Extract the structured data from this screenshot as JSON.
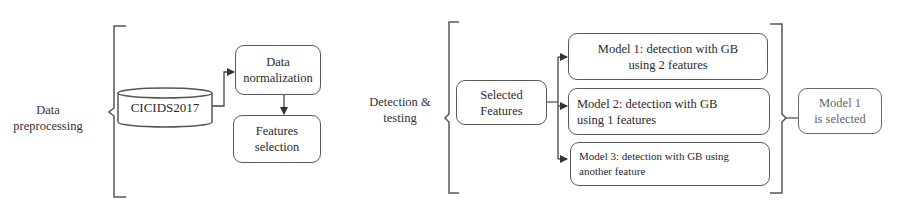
{
  "diagram": {
    "sections": [
      {
        "label_lines": [
          "Data",
          "preprocessing"
        ],
        "datasource": "CICIDS2017",
        "steps": [
          {
            "lines": [
              "Data",
              "normalization"
            ]
          },
          {
            "lines": [
              "Features",
              "selection"
            ]
          }
        ]
      },
      {
        "label_lines": [
          "Detection &",
          "testing"
        ],
        "input": {
          "lines": [
            "Selected",
            "Features"
          ]
        },
        "models": [
          {
            "lines": [
              "Model 1: detection with GB",
              "using 2 features"
            ]
          },
          {
            "lines": [
              "Model 2: detection with GB",
              "using 1 features"
            ]
          },
          {
            "lines": [
              "Model 3: detection with GB using",
              "another feature"
            ]
          }
        ],
        "result": {
          "lines": [
            "Model 1",
            "is selected"
          ]
        }
      }
    ],
    "colors": {
      "stroke": "#5a5a5a",
      "text": "#2a2a2a",
      "result_text": "#666666"
    }
  }
}
